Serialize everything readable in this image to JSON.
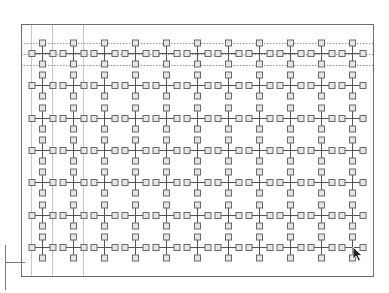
{
  "canvas": {
    "width": 389,
    "height": 293,
    "background": "#ffffff"
  },
  "frame": {
    "x": 21,
    "y": 24,
    "width": 352,
    "height": 252,
    "stroke": "#6e6e6e"
  },
  "grid": {
    "columns": 11,
    "rows": 7,
    "origin_x": 42,
    "origin_y": 53,
    "col_spacing": 31,
    "row_spacing": 32.3,
    "arm_length": 10.5,
    "node_size": 6,
    "arm_color": "#555555",
    "node_stroke": "#6a6a6a",
    "node_fill": "#e6e6e6"
  },
  "guides": {
    "horizontal_dotted": [
      43,
      54,
      65
    ],
    "vertical_solid": [
      31,
      52,
      83
    ],
    "dotted_color": "#9a9a9a",
    "solid_color": "#c8c8c8"
  },
  "bracket": {
    "vertical_x": 5,
    "vertical_y1": 245,
    "vertical_y2": 290,
    "horizontal_y": 262,
    "horizontal_x2": 25,
    "stroke": "#777777"
  },
  "cursor": {
    "icon": "arrow-pointer-icon",
    "x": 353,
    "y": 247,
    "color": "#222222"
  }
}
